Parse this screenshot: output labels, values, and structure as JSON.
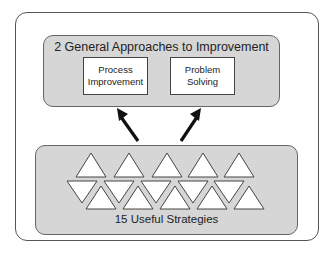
{
  "diagram": {
    "approaches": {
      "title": "2 General Approaches to Improvement",
      "items": [
        {
          "line1": "Process",
          "line2": "Improvement"
        },
        {
          "line1": "Problem",
          "line2": "Solving"
        }
      ]
    },
    "strategies": {
      "label": "15 Useful Strategies",
      "count": 15,
      "shape": "triangle"
    },
    "arrows": [
      {
        "from": "strategies",
        "to": "Process Improvement",
        "icon": "arrow-up-left-icon"
      },
      {
        "from": "strategies",
        "to": "Problem Solving",
        "icon": "arrow-up-right-icon"
      }
    ],
    "colors": {
      "panel_fill": "#d6d6d6",
      "box_fill": "#ffffff",
      "stroke": "#444444",
      "arrow": "#111111"
    }
  }
}
